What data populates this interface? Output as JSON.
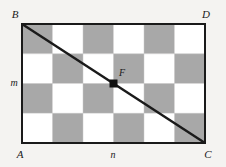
{
  "figure": {
    "type": "geometry-diagram",
    "background_color": "#f4f3f1",
    "shaded_color": "#a8a8a8",
    "unshaded_color": "#ffffff",
    "stroke_color": "#1a1a1a",
    "grid": {
      "columns": 6,
      "rows": 4,
      "first_cell_shaded": true,
      "pattern": [
        [
          "shaded",
          "white",
          "shaded",
          "white",
          "shaded",
          "white"
        ],
        [
          "white",
          "shaded",
          "white",
          "shaded",
          "white",
          "shaded"
        ],
        [
          "shaded",
          "white",
          "shaded",
          "white",
          "shaded",
          "white"
        ],
        [
          "white",
          "shaded",
          "white",
          "shaded",
          "white",
          "shaded"
        ]
      ]
    },
    "rect": {
      "x": 22,
      "y": 24,
      "width": 183,
      "height": 119
    },
    "diagonal": {
      "from": "B",
      "to": "C",
      "x1": 22,
      "y1": 24,
      "x2": 205,
      "y2": 143
    },
    "point": {
      "label": "F",
      "x": 113.5,
      "y": 83.5
    },
    "vertices": [
      {
        "label": "B",
        "x": 15,
        "y": 16,
        "corner": "top-left"
      },
      {
        "label": "D",
        "x": 205,
        "y": 16,
        "corner": "top-right"
      },
      {
        "label": "A",
        "x": 15,
        "y": 155,
        "corner": "bottom-left"
      },
      {
        "label": "C",
        "x": 205,
        "y": 155,
        "corner": "bottom-right"
      }
    ],
    "side_labels": [
      {
        "label": "m",
        "side": "left",
        "x": 14,
        "y": 85
      },
      {
        "label": "n",
        "side": "bottom",
        "x": 112,
        "y": 155
      }
    ]
  }
}
